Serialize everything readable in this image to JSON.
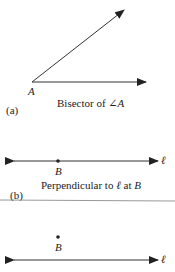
{
  "figure_a": {
    "panel_label": "(a)",
    "vertex_label": "A",
    "caption_prefix": "Bisector of ",
    "caption_angle_symbol": "∠",
    "caption_var": "A"
  },
  "figure_b": {
    "panel_label": "(b)",
    "point_label": "B",
    "line_label": "ℓ",
    "caption_prefix": "Perpendicular to ",
    "caption_line": "ℓ",
    "caption_mid": " at ",
    "caption_point": "B"
  },
  "figure_c": {
    "point_label": "B",
    "line_label": "ℓ"
  },
  "colors": {
    "stroke": "#333333",
    "separator": "#999999"
  }
}
